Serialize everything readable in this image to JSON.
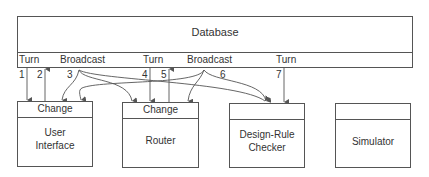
{
  "database": {
    "title": "Database",
    "ports": [
      "Turn",
      "Broadcast",
      "Turn",
      "Broadcast",
      "Turn"
    ]
  },
  "arrows": [
    "1",
    "2",
    "3",
    "4",
    "5",
    "6",
    "7"
  ],
  "components": [
    {
      "header": "Change",
      "name_line1": "User",
      "name_line2": "Interface"
    },
    {
      "header": "Change",
      "name_line1": "Router",
      "name_line2": ""
    },
    {
      "header": "",
      "name_line1": "Design-Rule",
      "name_line2": "Checker"
    },
    {
      "header": "",
      "name_line1": "Simulator",
      "name_line2": ""
    }
  ],
  "colors": {
    "line": "#555555",
    "text": "#333333",
    "background": "#ffffff"
  }
}
